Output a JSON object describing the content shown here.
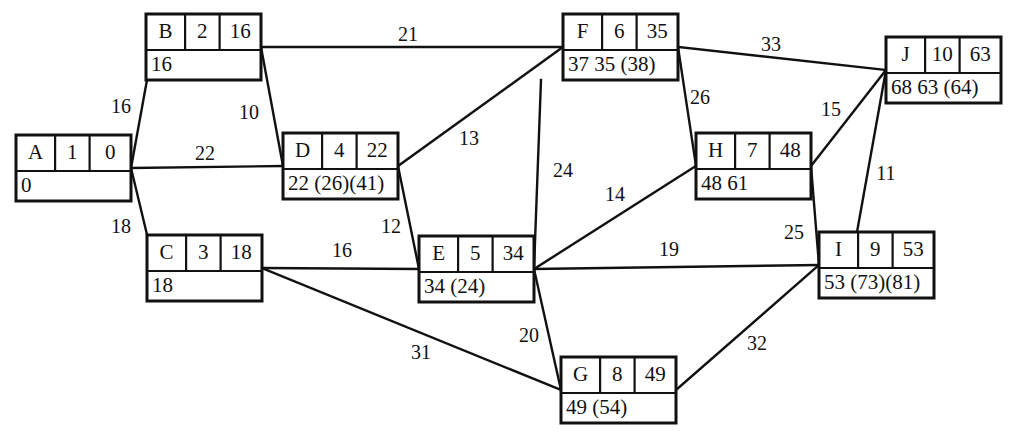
{
  "diagram": {
    "type": "network-diagram",
    "stroke_color": "#111111",
    "background_color": "#ffffff",
    "node_field_order": [
      "name",
      "duration",
      "early_start",
      "bottom_row"
    ],
    "nodes": [
      {
        "id": "A",
        "name": "A",
        "duration": "1",
        "value": "0",
        "bottom": "0",
        "x": 16,
        "y": 135,
        "w": 115,
        "h": 66
      },
      {
        "id": "B",
        "name": "B",
        "duration": "2",
        "value": "16",
        "bottom": "16",
        "x": 146,
        "y": 14,
        "w": 115,
        "h": 66
      },
      {
        "id": "C",
        "name": "C",
        "duration": "3",
        "value": "18",
        "bottom": "18",
        "x": 147,
        "y": 235,
        "w": 115,
        "h": 66
      },
      {
        "id": "D",
        "name": "D",
        "duration": "4",
        "value": "22",
        "bottom": "22 (26)(41)",
        "x": 283,
        "y": 133,
        "w": 115,
        "h": 66
      },
      {
        "id": "E",
        "name": "E",
        "duration": "5",
        "value": "34",
        "bottom": "34 (24)",
        "x": 419,
        "y": 236,
        "w": 115,
        "h": 66
      },
      {
        "id": "F",
        "name": "F",
        "duration": "6",
        "value": "35",
        "bottom": "37 35 (38)",
        "x": 563,
        "y": 14,
        "w": 115,
        "h": 66
      },
      {
        "id": "G",
        "name": "G",
        "duration": "8",
        "value": "49",
        "bottom": "49 (54)",
        "x": 561,
        "y": 357,
        "w": 115,
        "h": 66
      },
      {
        "id": "H",
        "name": "H",
        "duration": "7",
        "value": "48",
        "bottom": "48 61",
        "x": 696,
        "y": 133,
        "w": 115,
        "h": 66
      },
      {
        "id": "I",
        "name": "I",
        "duration": "9",
        "value": "53",
        "bottom": "53 (73)(81)",
        "x": 819,
        "y": 232,
        "w": 115,
        "h": 66
      },
      {
        "id": "J",
        "name": "J",
        "duration": "10",
        "value": "63",
        "bottom": "68 63 (64)",
        "x": 886,
        "y": 37,
        "w": 115,
        "h": 66
      }
    ],
    "edges": [
      {
        "id": "A-B",
        "from": "A",
        "to": "B",
        "label": "16",
        "lx": 121,
        "ly": 108,
        "x1": 131,
        "y1": 168,
        "x2": 153,
        "y2": 47
      },
      {
        "id": "A-D",
        "from": "A",
        "to": "D",
        "label": "22",
        "lx": 205,
        "ly": 155,
        "x1": 131,
        "y1": 168,
        "x2": 283,
        "y2": 166
      },
      {
        "id": "A-C",
        "from": "A",
        "to": "C",
        "label": "18",
        "lx": 121,
        "ly": 228,
        "x1": 131,
        "y1": 168,
        "x2": 155,
        "y2": 268
      },
      {
        "id": "B-F",
        "from": "B",
        "to": "F",
        "label": "21",
        "lx": 408,
        "ly": 36,
        "x1": 261,
        "y1": 47,
        "x2": 563,
        "y2": 47
      },
      {
        "id": "B-D",
        "from": "B",
        "to": "D",
        "label": "10",
        "lx": 249,
        "ly": 114,
        "x1": 261,
        "y1": 47,
        "x2": 283,
        "y2": 166
      },
      {
        "id": "D-F",
        "from": "D",
        "to": "F",
        "label": "13",
        "lx": 469,
        "ly": 140,
        "x1": 398,
        "y1": 166,
        "x2": 563,
        "y2": 47
      },
      {
        "id": "D-E",
        "from": "D",
        "to": "E",
        "label": "12",
        "lx": 391,
        "ly": 228,
        "x1": 398,
        "y1": 166,
        "x2": 419,
        "y2": 269
      },
      {
        "id": "C-E",
        "from": "C",
        "to": "E",
        "label": "16",
        "lx": 342,
        "ly": 252,
        "x1": 262,
        "y1": 268,
        "x2": 419,
        "y2": 269
      },
      {
        "id": "C-G",
        "from": "C",
        "to": "G",
        "label": "31",
        "lx": 421,
        "ly": 354,
        "x1": 262,
        "y1": 268,
        "x2": 561,
        "y2": 390
      },
      {
        "id": "E-F",
        "from": "E",
        "to": "F",
        "label": "24",
        "lx": 563,
        "ly": 172,
        "x1": 534,
        "y1": 269,
        "x2": 541,
        "y2": 80
      },
      {
        "id": "E-H",
        "from": "E",
        "to": "H",
        "label": "14",
        "lx": 615,
        "ly": 196,
        "x1": 534,
        "y1": 269,
        "x2": 696,
        "y2": 166
      },
      {
        "id": "E-I",
        "from": "E",
        "to": "I",
        "label": "19",
        "lx": 669,
        "ly": 251,
        "x1": 534,
        "y1": 269,
        "x2": 819,
        "y2": 265
      },
      {
        "id": "E-G",
        "from": "E",
        "to": "G",
        "label": "20",
        "lx": 529,
        "ly": 337,
        "x1": 534,
        "y1": 269,
        "x2": 561,
        "y2": 390
      },
      {
        "id": "F-J",
        "from": "F",
        "to": "J",
        "label": "33",
        "lx": 771,
        "ly": 46,
        "x1": 678,
        "y1": 47,
        "x2": 886,
        "y2": 70
      },
      {
        "id": "F-H",
        "from": "F",
        "to": "H",
        "label": "26",
        "lx": 700,
        "ly": 99,
        "x1": 678,
        "y1": 47,
        "x2": 696,
        "y2": 166
      },
      {
        "id": "H-J",
        "from": "H",
        "to": "J",
        "label": "15",
        "lx": 831,
        "ly": 111,
        "x1": 811,
        "y1": 166,
        "x2": 886,
        "y2": 70
      },
      {
        "id": "H-I",
        "from": "H",
        "to": "I",
        "label": "25",
        "lx": 794,
        "ly": 234,
        "x1": 811,
        "y1": 166,
        "x2": 819,
        "y2": 265
      },
      {
        "id": "J-I",
        "from": "J",
        "to": "I",
        "label": "11",
        "lx": 886,
        "ly": 175,
        "x1": 886,
        "y1": 70,
        "x2": 857,
        "y2": 232
      },
      {
        "id": "G-I",
        "from": "G",
        "to": "I",
        "label": "32",
        "lx": 757,
        "ly": 345,
        "x1": 676,
        "y1": 390,
        "x2": 819,
        "y2": 265
      }
    ]
  }
}
